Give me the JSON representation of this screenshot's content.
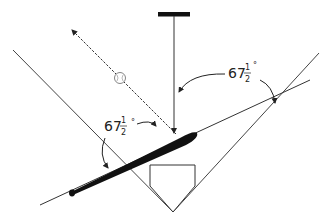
{
  "diagram": {
    "angle_labels": [
      {
        "whole": "67",
        "num": "1",
        "den": "2",
        "unit": "°"
      },
      {
        "whole": "67",
        "num": "1",
        "den": "2",
        "unit": "°"
      }
    ],
    "colors": {
      "line": "#333333",
      "bat": "#111111",
      "ball": "#666666",
      "background": "#ffffff"
    },
    "elements": [
      "pitcher-rubber",
      "pitch-path",
      "ball-path",
      "baseball",
      "foul-line-left",
      "foul-line-right",
      "home-plate",
      "bat"
    ]
  }
}
